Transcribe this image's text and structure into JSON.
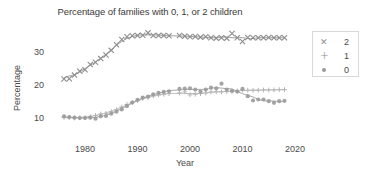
{
  "chart_data": {
    "type": "line",
    "title": "Percentage of families with 0, 1, or 2 children",
    "xlabel": "Year",
    "ylabel": "Percentage",
    "xlim": [
      1974,
      2022
    ],
    "ylim": [
      7,
      38
    ],
    "xticks": [
      "1980",
      "1990",
      "2000",
      "2010",
      "2020"
    ],
    "xtick_values": [
      1980,
      1990,
      2000,
      2010,
      2020
    ],
    "yticks": [
      "10",
      "20",
      "30"
    ],
    "ytick_values": [
      10,
      20,
      30
    ],
    "grid": false,
    "legend_position": "right",
    "legend_title": "",
    "x": [
      1976,
      1977,
      1978,
      1979,
      1980,
      1981,
      1982,
      1983,
      1984,
      1985,
      1986,
      1987,
      1988,
      1989,
      1990,
      1991,
      1992,
      1993,
      1994,
      1995,
      1996,
      1998,
      1999,
      2000,
      2001,
      2002,
      2003,
      2004,
      2005,
      2006,
      2007,
      2008,
      2009,
      2010,
      2011,
      2012,
      2013,
      2014,
      2015,
      2016,
      2017,
      2018
    ],
    "series": [
      {
        "name": "2",
        "marker": "x",
        "color": "#8d8d8d",
        "values": [
          21.8,
          21.9,
          23.0,
          24.2,
          24.6,
          26.2,
          26.9,
          28.0,
          29.1,
          30.5,
          32.2,
          33.8,
          34.6,
          34.9,
          35.0,
          35.1,
          35.8,
          35.0,
          35.0,
          35.0,
          34.9,
          35.0,
          34.8,
          34.6,
          34.7,
          34.5,
          34.6,
          34.3,
          34.2,
          34.3,
          34.2,
          35.6,
          34.3,
          33.2,
          34.4,
          34.3,
          34.3,
          34.3,
          34.4,
          34.3,
          34.3,
          34.3
        ]
      },
      {
        "name": "1",
        "marker": "+",
        "color": "#b4b4b4",
        "values": [
          10.2,
          10.1,
          10.0,
          10.1,
          10.1,
          10.4,
          10.8,
          11.2,
          11.4,
          11.9,
          12.5,
          13.3,
          14.1,
          14.7,
          15.3,
          15.9,
          16.2,
          16.7,
          17.0,
          17.2,
          17.4,
          17.6,
          17.9,
          17.0,
          17.2,
          17.4,
          17.6,
          17.9,
          18.0,
          17.9,
          18.0,
          18.1,
          18.2,
          18.5,
          18.4,
          18.4,
          18.4,
          18.5,
          18.5,
          18.5,
          18.6,
          18.6
        ]
      },
      {
        "name": "0",
        "marker": "o",
        "color": "#9a9a9a",
        "values": [
          10.5,
          10.3,
          10.1,
          10.0,
          10.0,
          10.1,
          9.8,
          10.5,
          10.6,
          11.3,
          11.9,
          12.6,
          13.6,
          14.7,
          15.5,
          16.2,
          16.5,
          17.2,
          17.6,
          17.9,
          18.1,
          18.8,
          18.9,
          19.0,
          18.6,
          18.0,
          18.6,
          19.2,
          19.0,
          20.4,
          18.6,
          18.2,
          18.0,
          18.8,
          16.6,
          15.3,
          15.6,
          15.6,
          15.1,
          14.6,
          15.1,
          15.2
        ]
      }
    ]
  }
}
